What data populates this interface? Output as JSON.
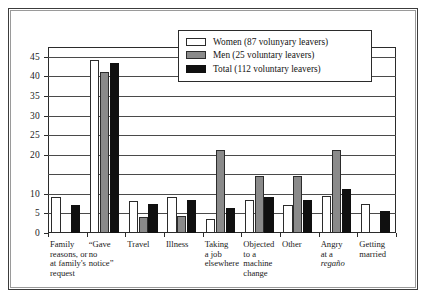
{
  "figure": {
    "frame": true
  },
  "legend": {
    "position": "top-right-inside",
    "entries": [
      {
        "key": "women",
        "label": "Women (87 volunyary leavers)",
        "swatch": "white-bar-swatch"
      },
      {
        "key": "men",
        "label": "Men (25 voluntary leavers)",
        "swatch": "grey-bar-swatch"
      },
      {
        "key": "total",
        "label": "Total (112 voluntary leavers)",
        "swatch": "black-bar-swatch"
      }
    ]
  },
  "colors": {
    "women": "#ffffff",
    "men": "#8a8a8a",
    "total": "#101010",
    "axis": "#2b2b2b",
    "grid": "#4a4a4a",
    "frame": "#3c3c3c"
  },
  "chart_data": {
    "type": "bar",
    "title": "",
    "subtitle": "",
    "xlabel": "",
    "ylabel": "",
    "ylim": [
      0,
      47.5
    ],
    "grid": true,
    "legend_position": "upper right",
    "yticks": [
      0,
      5,
      10,
      20,
      25,
      30,
      35,
      40,
      45
    ],
    "ytick_labels": [
      "0",
      "5",
      "10",
      "20",
      "25",
      "30",
      "35",
      "40",
      "45"
    ],
    "gridline_values": [
      0,
      5,
      10,
      15,
      20,
      25,
      30,
      35,
      40,
      45
    ],
    "categories": [
      "Family reasons, or at family's request",
      "“Gave no notice”",
      "Travel",
      "Illness",
      "Taking a job elsewhere",
      "Objected to a machine change",
      "Other",
      "Angry at a regaño",
      "Getting married"
    ],
    "category_lines": [
      [
        "Family",
        "reasons, or",
        "at family's",
        "request"
      ],
      [
        "“Gave",
        "no",
        "notice”"
      ],
      [
        "Travel"
      ],
      [
        "Illness"
      ],
      [
        "Taking",
        "a job",
        "elsewhere"
      ],
      [
        "Objected",
        "to a",
        "machine",
        "change"
      ],
      [
        "Other"
      ],
      [
        "Angry",
        "at a",
        "regaño"
      ],
      [
        "Getting",
        "married"
      ]
    ],
    "series": [
      {
        "name": "Women (87 volunyary leavers)",
        "key": "women",
        "values": [
          9.2,
          44.2,
          8.2,
          9.2,
          3.7,
          8.3,
          7.2,
          9.4,
          7.3
        ]
      },
      {
        "name": "Men (25 voluntary leavers)",
        "key": "men",
        "values": [
          0,
          41.1,
          4.1,
          4.3,
          21.1,
          14.5,
          14.5,
          21.2,
          0
        ]
      },
      {
        "name": "Total (112 voluntary leavers)",
        "key": "total",
        "values": [
          7.1,
          43.4,
          7.4,
          8.3,
          6.5,
          9.2,
          8.5,
          11.2,
          5.7
        ]
      }
    ]
  }
}
